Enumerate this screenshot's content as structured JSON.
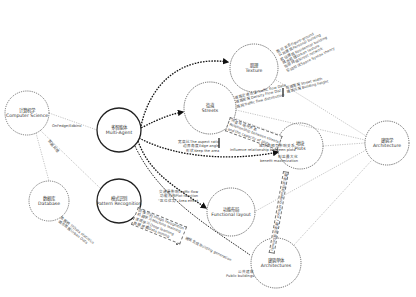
{
  "nodes": [
    {
      "id": "computer_science",
      "zh": "计算机学",
      "en": "Computer Science",
      "x": 27,
      "y": 113,
      "r": 22,
      "style": "dotted"
    },
    {
      "id": "multi_agent",
      "zh": "多智能体",
      "en": "Multi-Agent",
      "x": 119,
      "y": 130,
      "r": 22,
      "style": "solid-bold"
    },
    {
      "id": "database",
      "zh": "数据库",
      "en": "Database",
      "x": 49,
      "y": 201,
      "r": 20,
      "style": "dotted"
    },
    {
      "id": "pattern_recognition",
      "zh": "模式识别",
      "en": "Pattern Recognition",
      "x": 119,
      "y": 201,
      "r": 22,
      "style": "solid-bold"
    },
    {
      "id": "texture",
      "zh": "肌理",
      "en": "Texture",
      "x": 254,
      "y": 68,
      "r": 24,
      "style": "dotted"
    },
    {
      "id": "streets",
      "zh": "街道",
      "en": "Streets",
      "x": 210,
      "y": 108,
      "r": 26,
      "style": "dotted"
    },
    {
      "id": "plots",
      "zh": "地块",
      "en": "Plots",
      "x": 300,
      "y": 146,
      "r": 23,
      "style": "dotted"
    },
    {
      "id": "functional_layout",
      "zh": "功能布局",
      "en": "Functional layout",
      "x": 231,
      "y": 212,
      "r": 24,
      "style": "dotted"
    },
    {
      "id": "architectures",
      "zh": "建筑单体",
      "en": "Architectures",
      "x": 276,
      "y": 263,
      "r": 25,
      "style": "dotted"
    },
    {
      "id": "architecture",
      "zh": "建筑学",
      "en": "Architecture",
      "x": 387,
      "y": 143,
      "r": 22,
      "style": "dotted"
    }
  ],
  "edge_labels": {
    "cs_to_agent": "OnFedge/Edbino",
    "cs_to_database": "数据处理",
    "texture_notes": [
      "公共建筑Personal building",
      "居住建筑Residential building",
      "城市肌理Urban texture",
      "街道网络Street network",
      "空间句法Space Syntax theory",
      "图底关系Figure-ground"
    ],
    "streets_notes": [
      "道路交通流量Traffic flow Data",
      "道路密度Density Flow Dist.",
      "路网Traffic flow distribution"
    ],
    "streets_notes_right": [
      "街道宽度Street width",
      "建筑高度Building height"
    ],
    "streets_plots_box": [
      "街道与地块关系",
      "Relationship between streets",
      "and the capacity of plots"
    ],
    "agent_aspect": [
      "宽高比The aspect ratio",
      "边界角度Edge angle",
      "形状Keep the area"
    ],
    "plots_influence": [
      "地块间相互影响关系",
      "Influence relationship between plots"
    ],
    "plots_benefit": [
      "利益最大化",
      "benefit maximization"
    ],
    "functional_notes": [
      "交通量影响Traffic flow",
      "功能分布Plot function",
      "\"区位优势\" Area effect"
    ],
    "pattern_box": [
      "图像识别Image recognition",
      "机器学习Machine learning",
      "深度学习Deep learning",
      "数据挖掘Data mining"
    ],
    "database_notes": [
      "数据统计Data statistics",
      "城市数据Urban Data"
    ],
    "plots_arch_vertical": "建筑退线Building setback / 建筑密度Density",
    "to_architectures": "建筑生成Building generation",
    "public_buildings": [
      "公共建筑",
      "Public buildings"
    ]
  },
  "colors": {
    "line": "#333333",
    "thin_line": "#888888",
    "text": "#333333"
  }
}
